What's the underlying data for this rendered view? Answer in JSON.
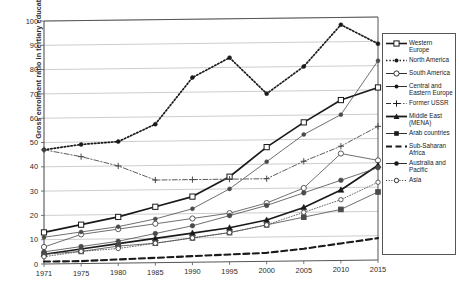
{
  "chart_data": {
    "type": "line",
    "title": "",
    "xlabel": "",
    "ylabel": "Gross enrolment ratio in tertiary education (in %)",
    "x": [
      1971,
      1975,
      1980,
      1985,
      1990,
      1995,
      2000,
      2005,
      2010,
      2015
    ],
    "xtick_labels": [
      "1971",
      "1975",
      "1980",
      "1985",
      "1990",
      "1995",
      "2000",
      "2005",
      "2010",
      "2015"
    ],
    "ytick_labels": [
      "0",
      "10",
      "20",
      "30",
      "40",
      "50",
      "60",
      "70",
      "80",
      "90",
      "100"
    ],
    "ylim": [
      0,
      100
    ],
    "xlim": [
      1971,
      2015
    ],
    "grid": "horizontal",
    "legend_position": "right-outside",
    "series": [
      {
        "name": "Western Europe",
        "marker": "open-square",
        "line": "solid-thick",
        "values": [
          13,
          16,
          19,
          23,
          27,
          35,
          47,
          57,
          66,
          71
        ]
      },
      {
        "name": "North America",
        "marker": "dot",
        "line": "dotted-thick",
        "values": [
          47,
          49,
          50,
          57,
          76,
          84,
          69,
          80,
          97,
          89
        ]
      },
      {
        "name": "South America",
        "marker": "open-circle",
        "line": "solid-thin",
        "values": [
          7,
          12,
          14,
          16,
          18,
          20,
          24,
          30,
          44,
          41
        ]
      },
      {
        "name": "Central and Eastern Europe",
        "marker": "dot",
        "line": "solid-thin",
        "values": [
          11,
          13,
          15,
          18,
          22,
          30,
          41,
          52,
          60,
          82
        ]
      },
      {
        "name": "Former USSR",
        "marker": "plus",
        "line": "dash-dot",
        "values": [
          47,
          44,
          40,
          34,
          34,
          34,
          34,
          41,
          47,
          55
        ]
      },
      {
        "name": "Middle East (MENA)",
        "marker": "filled-triangle",
        "line": "solid-thick",
        "values": [
          4,
          6,
          8,
          10,
          12,
          14,
          17,
          22,
          29,
          39
        ]
      },
      {
        "name": "Arab countries",
        "marker": "filled-square",
        "line": "solid-thin",
        "values": [
          4,
          5,
          7,
          8,
          10,
          12,
          15,
          18,
          21,
          28
        ]
      },
      {
        "name": "Sub-Saharan Africa",
        "marker": "none",
        "line": "dashed-thick",
        "values": [
          1,
          1,
          1.5,
          2,
          2.5,
          3,
          3.5,
          5,
          7,
          9
        ]
      },
      {
        "name": "Australia and Pacific",
        "marker": "filled-circle",
        "line": "solid-thin",
        "values": [
          5,
          7,
          9,
          12,
          15,
          19,
          23,
          28,
          33,
          38
        ]
      },
      {
        "name": "Asia",
        "marker": "open-circle-small",
        "line": "dotted-thin",
        "values": [
          3,
          5,
          6,
          8,
          10,
          12,
          15,
          20,
          25,
          32
        ]
      }
    ]
  },
  "legend": {
    "items": [
      {
        "label": "Western Europe",
        "sym": "open-square"
      },
      {
        "label": "North America",
        "sym": "dot"
      },
      {
        "label": "South America",
        "sym": "open-circle"
      },
      {
        "label": "Central and Eastern Europe",
        "sym": "dot-thin"
      },
      {
        "label": "Former USSR",
        "sym": "plus"
      },
      {
        "label": "Middle East (MENA)",
        "sym": "filled-triangle"
      },
      {
        "label": "Arab countries",
        "sym": "filled-square"
      },
      {
        "label": "Sub-Saharan Africa",
        "sym": "dashed"
      },
      {
        "label": "Australia and Pacific",
        "sym": "filled-circle"
      },
      {
        "label": "Asia",
        "sym": "open-circle-small"
      }
    ]
  },
  "colors": {
    "axis": "#555555",
    "grid": "#b8b8b8",
    "ink": "#1a1a1a",
    "thin": "#4a4a4a",
    "background": "#ffffff"
  }
}
